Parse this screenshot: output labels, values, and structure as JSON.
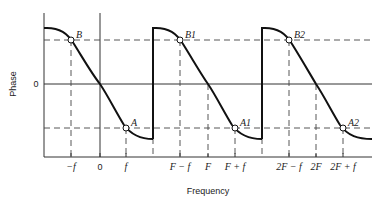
{
  "diagram": {
    "ylabel": "Phase",
    "xlabel": "Frequency",
    "y_zero_label": "0",
    "x_ticks": [
      {
        "label": "−f",
        "x": 71
      },
      {
        "label": "0",
        "x": 100
      },
      {
        "label": "f",
        "x": 126
      },
      {
        "label": "F − f",
        "x": 180
      },
      {
        "label": "F",
        "x": 208
      },
      {
        "label": "F + f",
        "x": 235
      },
      {
        "label": "2F − f",
        "x": 289
      },
      {
        "label": "2F",
        "x": 316
      },
      {
        "label": "2F + f",
        "x": 343
      }
    ],
    "points": [
      {
        "label": "B",
        "x": 71,
        "y": 40
      },
      {
        "label": "A",
        "x": 126,
        "y": 128
      },
      {
        "label": "B1",
        "x": 180,
        "y": 40
      },
      {
        "label": "A1",
        "x": 235,
        "y": 128
      },
      {
        "label": "B2",
        "x": 289,
        "y": 40
      },
      {
        "label": "A2",
        "x": 343,
        "y": 128
      }
    ],
    "periods": [
      {
        "center_label": "0"
      },
      {
        "center_label": "F"
      },
      {
        "center_label": "2F"
      }
    ],
    "colors": {
      "curve": "#111111",
      "axis": "#333333",
      "dashed": "#444444",
      "background": "#ffffff"
    }
  }
}
